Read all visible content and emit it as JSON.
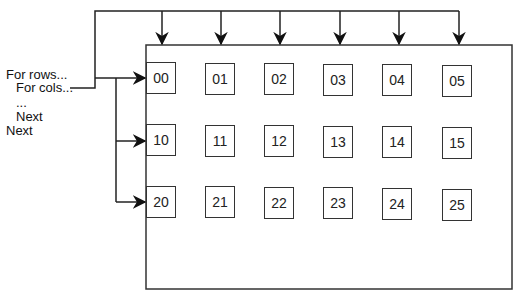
{
  "pseudocode": {
    "lines": [
      {
        "text": "For rows...",
        "x": 6,
        "y": 68
      },
      {
        "text": "For cols...",
        "x": 16,
        "y": 81
      },
      {
        "text": "...",
        "x": 16,
        "y": 96
      },
      {
        "text": "Next",
        "x": 16,
        "y": 110
      },
      {
        "text": "Next",
        "x": 6,
        "y": 124
      }
    ]
  },
  "grid": {
    "rows": [
      [
        "00",
        "01",
        "02",
        "03",
        "04",
        "05"
      ],
      [
        "10",
        "11",
        "12",
        "13",
        "14",
        "15"
      ],
      [
        "20",
        "21",
        "22",
        "23",
        "24",
        "25"
      ]
    ],
    "col_x": [
      146,
      205,
      264,
      323,
      382,
      442
    ],
    "row_y": [
      63,
      126,
      188
    ]
  },
  "colors": {
    "line": "#222222",
    "cell_border": "#333333",
    "background": "#ffffff"
  }
}
